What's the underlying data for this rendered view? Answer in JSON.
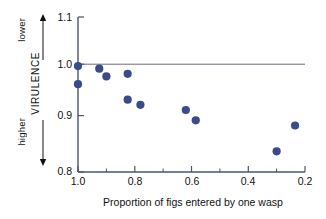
{
  "chart_data": {
    "type": "scatter",
    "title": "",
    "xlabel": "Proportion of figs entered by one wasp",
    "ylabel": "VIRULENCE",
    "ylabel_top_note": "lower",
    "ylabel_bottom_note": "higher",
    "xlim": [
      1.0,
      0.2
    ],
    "ylim": [
      0.8,
      1.1
    ],
    "x_inverted": true,
    "grid": false,
    "legend": null,
    "marker_color": "#3a4a8c",
    "axis_color": "#5a6header",
    "reference_lines": [
      {
        "axis": "y",
        "value": 1.0,
        "color": "#6b6f7d"
      }
    ],
    "xticks": [
      1.0,
      0.8,
      0.6,
      0.4,
      0.2
    ],
    "xtick_labels": [
      "1.0",
      "0.8",
      "0.6",
      "0.4",
      "0.2"
    ],
    "xminor_ticks": [
      0.9,
      0.7,
      0.5,
      0.3
    ],
    "yticks": [
      0.8,
      0.9,
      1.0,
      1.1
    ],
    "ytick_labels": [
      "0.8",
      "0.9",
      "1.0",
      "1.1"
    ],
    "points": [
      {
        "x": 1.0,
        "y": 1.005
      },
      {
        "x": 1.0,
        "y": 0.97
      },
      {
        "x": 0.925,
        "y": 1.0
      },
      {
        "x": 0.9,
        "y": 0.985
      },
      {
        "x": 0.825,
        "y": 0.99
      },
      {
        "x": 0.825,
        "y": 0.94
      },
      {
        "x": 0.78,
        "y": 0.93
      },
      {
        "x": 0.62,
        "y": 0.92
      },
      {
        "x": 0.585,
        "y": 0.9
      },
      {
        "x": 0.3,
        "y": 0.84
      },
      {
        "x": 0.235,
        "y": 0.89
      }
    ]
  },
  "axis": {
    "x_title": "Proportion of figs entered by one wasp",
    "y_title": "VIRULENCE",
    "y_note_top": "lower",
    "y_note_bottom": "higher",
    "ytick_0": "1.1",
    "ytick_1": "1.0",
    "ytick_2": "0.9",
    "ytick_3": "0.8",
    "xtick_0": "1.0",
    "xtick_1": "0.8",
    "xtick_2": "0.6",
    "xtick_3": "0.4",
    "xtick_4": "0.2"
  }
}
